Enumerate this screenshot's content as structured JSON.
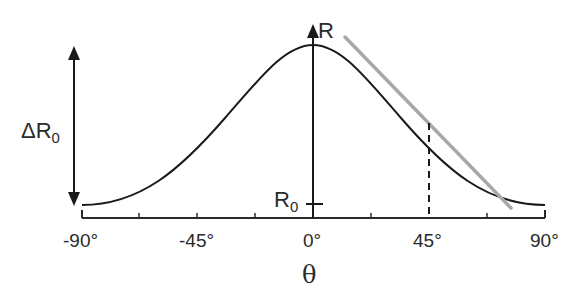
{
  "diagram": {
    "type": "cosine-squared response curve with tangent at 45°",
    "curve_color": "#1a1a1a",
    "tangent_color": "#a8a8a8",
    "axis_color": "#2a2a2a"
  },
  "labels": {
    "y_axis": "R",
    "baseline_main": "R",
    "baseline_sub": "0",
    "delta_main": "ΔR",
    "delta_sub": "0",
    "x_axis": "θ"
  },
  "x_ticks": [
    "-90°",
    "-45°",
    "0°",
    "45°",
    "90°"
  ],
  "annotations": {
    "dashed_marker_at": "45°",
    "tangent_point": "45°"
  }
}
